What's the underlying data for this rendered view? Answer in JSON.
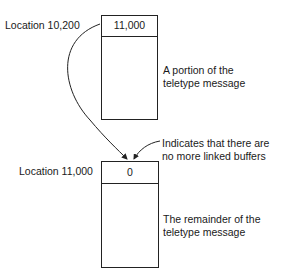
{
  "diagram": {
    "type": "linked-buffer-diagram",
    "buffers": [
      {
        "location_label": "Location 10,200",
        "link_value": "11,000",
        "description": [
          "A portion of the",
          "teletype message"
        ]
      },
      {
        "location_label": "Location 11,000",
        "link_value": "0",
        "description": [
          "The remainder of the",
          "teletype message"
        ]
      }
    ],
    "annotation": [
      "Indicates that there are",
      "no more linked buffers"
    ],
    "arrows": [
      {
        "from": "buffer 1 location label",
        "to": "buffer 2 link field",
        "style": "curved"
      },
      {
        "from": "annotation",
        "to": "buffer 2 link field",
        "style": "curved"
      }
    ]
  }
}
